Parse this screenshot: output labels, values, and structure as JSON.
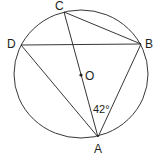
{
  "diagram": {
    "type": "circle-inscribed-quadrilateral",
    "circle": {
      "center": "O",
      "cx": 81,
      "cy": 74,
      "rx": 67,
      "ry": 64
    },
    "points": [
      {
        "id": "A",
        "label": "A",
        "x": 98,
        "y": 137,
        "label_x": 94,
        "label_y": 153
      },
      {
        "id": "B",
        "label": "B",
        "x": 141,
        "y": 44,
        "label_x": 145,
        "label_y": 48
      },
      {
        "id": "C",
        "label": "C",
        "x": 64,
        "y": 12,
        "label_x": 55,
        "label_y": 10
      },
      {
        "id": "D",
        "label": "D",
        "x": 21,
        "y": 45,
        "label_x": 7,
        "label_y": 48
      },
      {
        "id": "O",
        "label": "O",
        "x": 81,
        "y": 75,
        "label_x": 85,
        "label_y": 80
      }
    ],
    "segments": [
      [
        "C",
        "A"
      ],
      [
        "C",
        "B"
      ],
      [
        "D",
        "B"
      ],
      [
        "D",
        "A"
      ],
      [
        "B",
        "A"
      ]
    ],
    "angle_annotation": {
      "label": "42°",
      "at": "A",
      "x": 93,
      "y": 113
    },
    "stroke_color": "#231f20"
  }
}
